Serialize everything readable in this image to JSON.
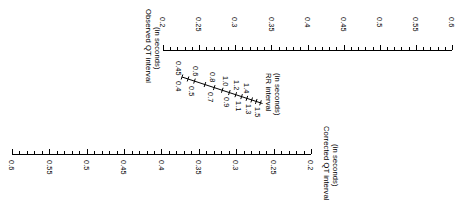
{
  "figure": {
    "kind": "nomogram",
    "orientation_note": "rotated 90 degrees clockwise",
    "ink_color": "#000000",
    "background_color": "#ffffff"
  },
  "chart_data": {
    "type": "line",
    "title": "",
    "subtitle": "",
    "xlabel": "",
    "ylabel": "",
    "grid": false,
    "legend": "none",
    "scales": [
      {
        "id": "observed-qt",
        "name": "Observed QT interval",
        "units": "(in seconds)",
        "direction": "0.2 at left to 0.6 at right",
        "range": [
          0.2,
          0.6
        ],
        "major_step": 0.05,
        "minor_step": 0.01,
        "tick_labels": [
          "0.2",
          "0.25",
          "0.3",
          "0.35",
          "0.4",
          "0.45",
          "0.5",
          "0.55",
          "0.6"
        ],
        "tick_values": [
          0.2,
          0.25,
          0.3,
          0.35,
          0.4,
          0.45,
          0.5,
          0.55,
          0.6
        ]
      },
      {
        "id": "rr-interval",
        "name": "RR interval",
        "units": "(in seconds)",
        "direction": "0.4 at upper-left to 1.5 at lower-right",
        "range": [
          0.4,
          1.5
        ],
        "tick_labels": [
          "0.4",
          "0.45",
          "0.5",
          "0.6",
          "0.7",
          "0.8",
          "0.9",
          "1.0",
          "1.1",
          "1.2",
          "1.3",
          "1.4",
          "1.5"
        ],
        "tick_values": [
          0.4,
          0.45,
          0.5,
          0.6,
          0.7,
          0.8,
          0.9,
          1.0,
          1.1,
          1.2,
          1.3,
          1.4,
          1.5
        ]
      },
      {
        "id": "corrected-qt",
        "name": "Corrected QT interval",
        "units": "(in seconds)",
        "direction": "0.6 at left to 0.2 at right",
        "range": [
          0.6,
          0.2
        ],
        "major_step": 0.05,
        "minor_step": 0.01,
        "tick_labels": [
          "0.6",
          "0.55",
          "0.5",
          "0.45",
          "0.4",
          "0.35",
          "0.3",
          "0.25",
          "0.2"
        ],
        "tick_values": [
          0.6,
          0.55,
          0.5,
          0.45,
          0.4,
          0.35,
          0.3,
          0.25,
          0.2
        ]
      }
    ]
  },
  "observed_axis": {
    "title": "Observed QT interval",
    "units": "(in seconds)",
    "ticks": [
      "0.2",
      "0.25",
      "0.3",
      "0.35",
      "0.4",
      "0.45",
      "0.5",
      "0.55",
      "0.6"
    ]
  },
  "rr_axis": {
    "title": "RR interval",
    "units": "(in seconds)",
    "ticks_upper": [
      "0.45",
      "0.6",
      "0.8",
      "1.0",
      "1.2",
      "1.4"
    ],
    "ticks_lower": [
      "0.4",
      "0.5",
      "0.7",
      "0.9",
      "1.1",
      "1.3",
      "1.5"
    ],
    "ticks_all": [
      "0.4",
      "0.45",
      "0.5",
      "0.6",
      "0.7",
      "0.8",
      "0.9",
      "1.0",
      "1.1",
      "1.2",
      "1.3",
      "1.4",
      "1.5"
    ]
  },
  "corrected_axis": {
    "title": "Corrected QT interval",
    "units": "(in seconds)",
    "ticks": [
      "0.6",
      "0.55",
      "0.5",
      "0.45",
      "0.4",
      "0.35",
      "0.3",
      "0.25",
      "0.2"
    ]
  }
}
